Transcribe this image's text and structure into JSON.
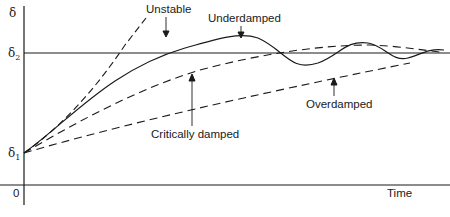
{
  "diagram": {
    "type": "step-response-curves",
    "y_axis": {
      "label": "δ",
      "markers": [
        {
          "name": "δ2",
          "base": "δ",
          "sub": "2"
        },
        {
          "name": "δ1",
          "base": "δ",
          "sub": "1"
        }
      ]
    },
    "x_axis": {
      "label": "Time",
      "origin_label": "0"
    },
    "curves": [
      {
        "name": "Unstable",
        "style": "dashed",
        "annotation": "Unstable"
      },
      {
        "name": "Underdamped",
        "style": "solid",
        "annotation": "Underdamped"
      },
      {
        "name": "Critically damped",
        "style": "dashed",
        "annotation": "Critically damped"
      },
      {
        "name": "Overdamped",
        "style": "dashed",
        "annotation": "Overdamped"
      }
    ],
    "colors": {
      "line": "#1a1a1a",
      "background": "#ffffff"
    }
  }
}
